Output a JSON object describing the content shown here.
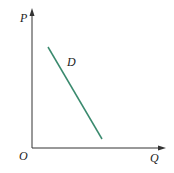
{
  "diagram": {
    "type": "demand-curve",
    "axes": {
      "y_label": "P",
      "x_label": "Q",
      "origin_label": "O",
      "color": "#333333"
    },
    "curve": {
      "label": "D",
      "color": "#3a8a6e",
      "from": [
        48,
        47
      ],
      "to": [
        102,
        139
      ]
    }
  }
}
